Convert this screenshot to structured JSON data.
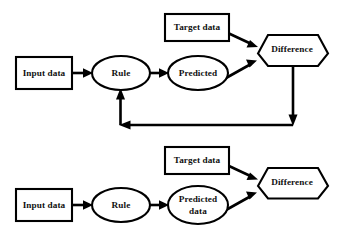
{
  "figure": {
    "title": "",
    "background_color": "#ffffff",
    "stroke_color": "#000000",
    "text_color": "#111111"
  },
  "diagrams": [
    {
      "id": "top-diagram",
      "name": "rule-learning-with-feedback",
      "nodes": [
        {
          "id": "input-data",
          "label": "Input data",
          "shape": "rectangle"
        },
        {
          "id": "rule",
          "label": "Rule",
          "shape": "ellipse"
        },
        {
          "id": "predicted",
          "label": "Predicted",
          "shape": "ellipse"
        },
        {
          "id": "target-data",
          "label": "Target data",
          "shape": "rectangle"
        },
        {
          "id": "difference",
          "label": "Difference",
          "shape": "hexagon"
        }
      ],
      "edges": [
        {
          "id": "e1",
          "from": "input-data",
          "to": "rule",
          "style": "straight"
        },
        {
          "id": "e2",
          "from": "rule",
          "to": "predicted",
          "style": "straight"
        },
        {
          "id": "e3",
          "from": "predicted",
          "to": "difference",
          "style": "diagonal"
        },
        {
          "id": "e4",
          "from": "target-data",
          "to": "difference",
          "style": "diagonal"
        },
        {
          "id": "e5",
          "from": "difference",
          "to": "rule",
          "style": "feedback-loop"
        }
      ]
    },
    {
      "id": "bottom-diagram",
      "name": "rule-prediction-no-feedback",
      "nodes": [
        {
          "id": "input-data-2",
          "label": "Input data",
          "shape": "rectangle"
        },
        {
          "id": "rule-2",
          "label": "Rule",
          "shape": "ellipse"
        },
        {
          "id": "predicted-data",
          "label_line1": "Predicted",
          "label_line2": "data",
          "label": "Predicted data",
          "shape": "ellipse"
        },
        {
          "id": "target-data-2",
          "label": "Target data",
          "shape": "rectangle"
        },
        {
          "id": "difference-2",
          "label": "Difference",
          "shape": "hexagon"
        }
      ],
      "edges": [
        {
          "id": "b1",
          "from": "input-data-2",
          "to": "rule-2",
          "style": "straight"
        },
        {
          "id": "b2",
          "from": "rule-2",
          "to": "predicted-data",
          "style": "straight"
        },
        {
          "id": "b3",
          "from": "predicted-data",
          "to": "difference-2",
          "style": "diagonal"
        },
        {
          "id": "b4",
          "from": "target-data-2",
          "to": "difference-2",
          "style": "diagonal"
        }
      ]
    }
  ]
}
